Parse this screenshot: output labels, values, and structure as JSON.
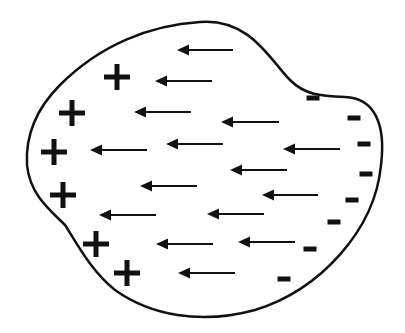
{
  "diagram": {
    "colors": {
      "stroke": "#111111",
      "background": "#ffffff"
    },
    "outline_path": "M 200 22 C 250 18 270 60 290 80 C 305 95 320 96 345 97 C 375 98 386 125 381 165 C 375 230 320 290 255 310 C 200 325 150 315 115 290 C 90 270 75 240 65 225 C 50 210 30 195 27 165 C 25 130 40 105 60 85 C 100 45 150 25 200 22 Z",
    "positive_charges": [
      {
        "x": 117,
        "y": 77
      },
      {
        "x": 72,
        "y": 113
      },
      {
        "x": 54,
        "y": 152
      },
      {
        "x": 63,
        "y": 195
      },
      {
        "x": 96,
        "y": 244
      },
      {
        "x": 127,
        "y": 273
      }
    ],
    "negative_charges": [
      {
        "x": 313,
        "y": 98
      },
      {
        "x": 354,
        "y": 118
      },
      {
        "x": 364,
        "y": 144
      },
      {
        "x": 366,
        "y": 174
      },
      {
        "x": 352,
        "y": 200
      },
      {
        "x": 334,
        "y": 222
      },
      {
        "x": 310,
        "y": 249
      },
      {
        "x": 284,
        "y": 279
      }
    ],
    "field_arrows": [
      {
        "x1": 233,
        "x2": 177,
        "y": 50
      },
      {
        "x1": 212,
        "x2": 155,
        "y": 81
      },
      {
        "x1": 191,
        "x2": 134,
        "y": 112
      },
      {
        "x1": 279,
        "x2": 221,
        "y": 122
      },
      {
        "x1": 147,
        "x2": 90,
        "y": 150
      },
      {
        "x1": 223,
        "x2": 166,
        "y": 144
      },
      {
        "x1": 340,
        "x2": 283,
        "y": 149
      },
      {
        "x1": 287,
        "x2": 230,
        "y": 170
      },
      {
        "x1": 197,
        "x2": 140,
        "y": 186
      },
      {
        "x1": 318,
        "x2": 262,
        "y": 195
      },
      {
        "x1": 156,
        "x2": 99,
        "y": 215
      },
      {
        "x1": 264,
        "x2": 207,
        "y": 214
      },
      {
        "x1": 213,
        "x2": 156,
        "y": 244
      },
      {
        "x1": 295,
        "x2": 238,
        "y": 242
      },
      {
        "x1": 235,
        "x2": 178,
        "y": 273
      }
    ]
  }
}
